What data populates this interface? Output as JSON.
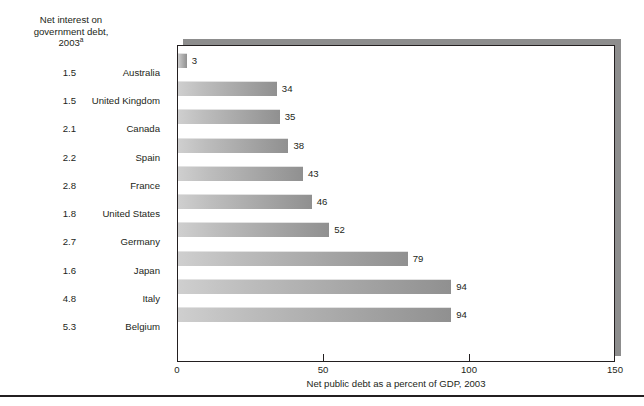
{
  "left_header": {
    "line1": "Net interest on",
    "line2": "government debt,",
    "line3": "2003",
    "footnote_marker": "a"
  },
  "title_remnant": "",
  "axis": {
    "title": "Net public debt as a percent of GDP, 2003",
    "tick_labels": [
      "0",
      "50",
      "100",
      "150"
    ]
  },
  "chart_data": {
    "type": "bar",
    "orientation": "horizontal",
    "title": "",
    "xlabel": "Net public debt as a percent of GDP, 2003",
    "ylabel": "",
    "xlim": [
      0,
      150
    ],
    "xticks": [
      0,
      50,
      100,
      150
    ],
    "grid": false,
    "legend": "none",
    "categories": [
      "Australia",
      "United Kingdom",
      "Canada",
      "Spain",
      "France",
      "United States",
      "Germany",
      "Japan",
      "Italy",
      "Belgium"
    ],
    "values": [
      3,
      34,
      35,
      38,
      43,
      46,
      52,
      79,
      94,
      94
    ],
    "value_labels": [
      "3",
      "34",
      "35",
      "38",
      "43",
      "46",
      "52",
      "79",
      "94",
      "94"
    ],
    "secondary_column": {
      "name": "Net interest on government debt, 2003",
      "values": [
        1.5,
        1.5,
        2.1,
        2.2,
        2.8,
        1.8,
        2.7,
        1.6,
        4.8,
        5.3
      ],
      "labels": [
        "1.5",
        "1.5",
        "2.1",
        "2.2",
        "2.8",
        "1.8",
        "2.7",
        "1.6",
        "4.8",
        "5.3"
      ]
    },
    "colors": {
      "bar_light": "#cfcfcf",
      "bar_dark": "#909090",
      "frame": "#231f20",
      "shadow": "#8d8d8d",
      "text": "#231f20",
      "background": "#ffffff"
    }
  },
  "rows": [
    {
      "interest": "1.5",
      "country": "Australia",
      "value": "3",
      "num": 3
    },
    {
      "interest": "1.5",
      "country": "United Kingdom",
      "value": "34",
      "num": 34
    },
    {
      "interest": "2.1",
      "country": "Canada",
      "value": "35",
      "num": 35
    },
    {
      "interest": "2.2",
      "country": "Spain",
      "value": "38",
      "num": 38
    },
    {
      "interest": "2.8",
      "country": "France",
      "value": "43",
      "num": 43
    },
    {
      "interest": "1.8",
      "country": "United States",
      "value": "46",
      "num": 46
    },
    {
      "interest": "2.7",
      "country": "Germany",
      "value": "52",
      "num": 52
    },
    {
      "interest": "1.6",
      "country": "Japan",
      "value": "79",
      "num": 79
    },
    {
      "interest": "4.8",
      "country": "Italy",
      "value": "94",
      "num": 94
    },
    {
      "interest": "5.3",
      "country": "Belgium",
      "value": "94",
      "num": 94
    }
  ]
}
